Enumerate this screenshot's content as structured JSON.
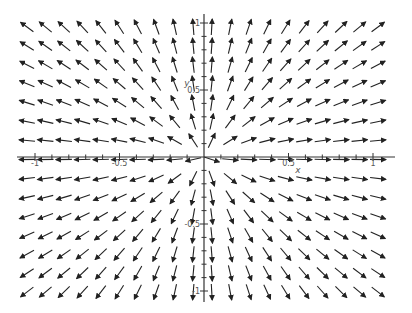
{
  "chart_data": {
    "type": "vector_field",
    "title": "",
    "xlabel": "x",
    "ylabel": "y",
    "xlim": [
      -1.1,
      1.1
    ],
    "ylim": [
      -1.1,
      1.1
    ],
    "field": "radial outward (source): arrows point away from origin, normalized length",
    "grid": {
      "cols": 20,
      "rows": 15
    },
    "x_ticks": [
      {
        "value": -1,
        "label": "-1"
      },
      {
        "value": -0.5,
        "label": "-0.5"
      },
      {
        "value": 0.5,
        "label": "0.5"
      },
      {
        "value": 1,
        "label": "1"
      }
    ],
    "y_ticks": [
      {
        "value": 1,
        "label": "1"
      },
      {
        "value": 0.5,
        "label": "0.5"
      },
      {
        "value": -0.5,
        "label": "-0.5"
      },
      {
        "value": -1,
        "label": "-1"
      }
    ],
    "arrow_color": "#222222",
    "axis_color": "#333333"
  }
}
